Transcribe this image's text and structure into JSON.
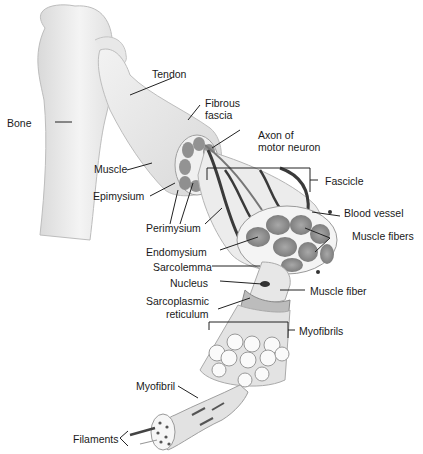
{
  "figure": {
    "type": "anatomical-diagram"
  },
  "labels": {
    "tendon": "Tendon",
    "fibrous_fascia_1": "Fibrous",
    "fibrous_fascia_2": "fascia",
    "bone": "Bone",
    "axon_1": "Axon of",
    "axon_2": "motor neuron",
    "muscle": "Muscle",
    "fascicle": "Fascicle",
    "epimysium": "Epimysium",
    "blood_vessel": "Blood vessel",
    "perimysium": "Perimysium",
    "muscle_fibers": "Muscle fibers",
    "endomysium": "Endomysium",
    "sarcolemma": "Sarcolemma",
    "nucleus": "Nucleus",
    "muscle_fiber": "Muscle fiber",
    "sr_1": "Sarcoplasmic",
    "sr_2": "reticulum",
    "myofibrils": "Myofibrils",
    "myofibril": "Myofibril",
    "filaments": "Filaments"
  },
  "colors": {
    "background": "#ffffff",
    "bone_fill": "#ededed",
    "muscle_fill": "#e6e6e6",
    "fascicle_fill": "#8f8f8f",
    "vessel": "#3a3a3a",
    "leader_line": "#222222",
    "text": "#1a1a1a"
  }
}
